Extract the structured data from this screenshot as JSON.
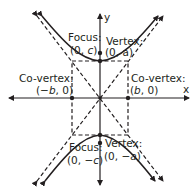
{
  "diagram": {
    "colors": {
      "stroke": "#231f20",
      "background": "#ffffff"
    },
    "axes": {
      "x_label": "x",
      "y_label": "y"
    },
    "labels": {
      "focus_top_title": "Focus:",
      "focus_top_coord_prefix": "(0, ",
      "focus_top_coord_var": "c",
      "focus_top_coord_suffix": ")",
      "vertex_top_title": "Vertex:",
      "vertex_top_coord": "(0, a)",
      "covertex_left_title": "Co-vertex:",
      "covertex_left_coord_prefix": "(−",
      "covertex_left_coord_var": "b",
      "covertex_left_coord_suffix": ", 0)",
      "covertex_right_title": "Co-vertex:",
      "covertex_right_coord_prefix": "(",
      "covertex_right_coord_var": "b",
      "covertex_right_coord_suffix": ", 0)",
      "focus_bottom_title": "Focus:",
      "focus_bottom_coord_prefix": "(0, −",
      "focus_bottom_coord_var": "c",
      "focus_bottom_coord_suffix": ")",
      "vertex_bottom_title": "Vertex:",
      "vertex_bottom_coord_prefix": "(0, −",
      "vertex_bottom_coord_var": "a",
      "vertex_bottom_coord_suffix": ")"
    },
    "points": [
      {
        "name": "vertex-top",
        "label": "(0, a)"
      },
      {
        "name": "focus-top",
        "label": "(0, c)"
      },
      {
        "name": "covertex-left",
        "label": "(-b, 0)"
      },
      {
        "name": "covertex-right",
        "label": "(b, 0)"
      },
      {
        "name": "vertex-bottom",
        "label": "(0, -a)"
      },
      {
        "name": "focus-bottom",
        "label": "(0, -c)"
      }
    ]
  }
}
